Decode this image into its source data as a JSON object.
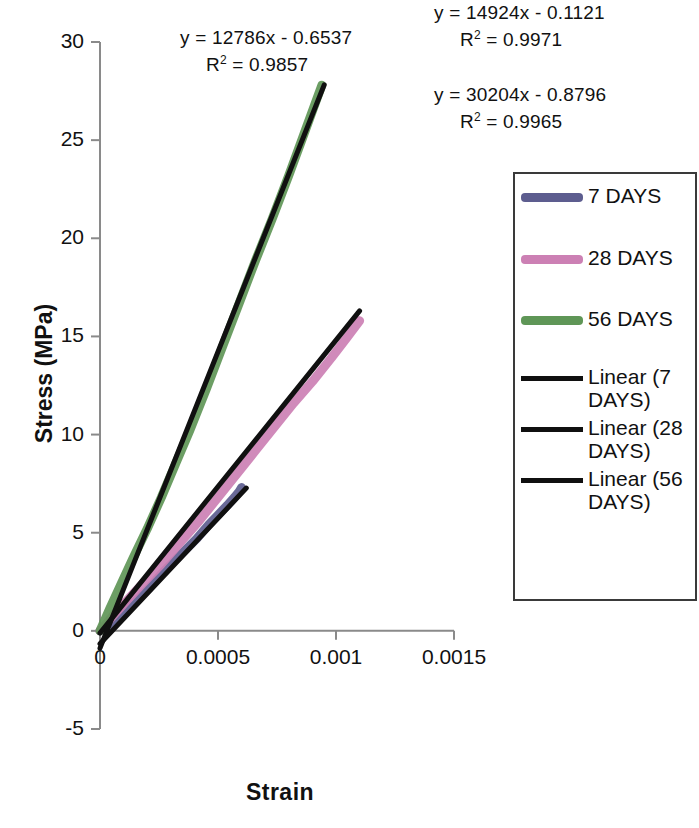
{
  "chart_data": {
    "type": "line",
    "title": "",
    "xlabel": "Strain",
    "ylabel": "Stress (MPa)",
    "xlim": [
      0,
      0.0015
    ],
    "ylim": [
      -5,
      30
    ],
    "xticks": [
      "0",
      "0.0005",
      "0.001",
      "0.0015"
    ],
    "xtick_values": [
      0,
      0.0005,
      0.001,
      0.0015
    ],
    "yticks": [
      "-5",
      "0",
      "5",
      "10",
      "15",
      "20",
      "25",
      "30"
    ],
    "ytick_values": [
      -5,
      0,
      5,
      10,
      15,
      20,
      25,
      30
    ],
    "grid": false,
    "legend_position": "right",
    "series": [
      {
        "name": "7 DAYS",
        "color": "#5d5d8f",
        "kind": "data",
        "x": [
          0,
          4e-05,
          9e-05,
          0.00015,
          0.00021,
          0.00026,
          0.00031,
          0.00036,
          0.00041,
          0.00046,
          0.0005,
          0.00054,
          0.00057,
          0.00059,
          0.0006
        ],
        "y": [
          0,
          0.35,
          0.9,
          1.5,
          2.2,
          2.9,
          3.5,
          4.1,
          4.7,
          5.4,
          5.9,
          6.4,
          6.8,
          7.1,
          7.3
        ]
      },
      {
        "name": "28 DAYS",
        "color": "#cc80b4",
        "kind": "data",
        "x": [
          0,
          5e-05,
          0.00011,
          0.00018,
          0.00026,
          0.00034,
          0.00042,
          0.0005,
          0.00058,
          0.00066,
          0.00074,
          0.00082,
          0.0009,
          0.00098,
          0.00105,
          0.0011
        ],
        "y": [
          0,
          0.7,
          1.5,
          2.4,
          3.4,
          4.5,
          5.6,
          6.8,
          8.0,
          9.2,
          10.4,
          11.6,
          12.7,
          13.9,
          15.0,
          15.8
        ]
      },
      {
        "name": "56 DAYS",
        "color": "#5f9657",
        "kind": "data",
        "x": [
          0,
          4e-05,
          9e-05,
          0.00014,
          0.0002,
          0.00026,
          0.00032,
          0.00038,
          0.00045,
          0.00052,
          0.00059,
          0.00066,
          0.00073,
          0.0008,
          0.00087,
          0.00094
        ],
        "y": [
          0,
          1.1,
          2.4,
          3.7,
          5.2,
          6.8,
          8.5,
          10.2,
          12.3,
          14.5,
          16.7,
          18.9,
          21.0,
          23.2,
          25.5,
          27.8
        ]
      },
      {
        "name": "Linear (7 DAYS)",
        "color": "#101010",
        "kind": "trendline",
        "slope": 12786,
        "intercept": -0.6537,
        "r2": 0.9857,
        "x_range": [
          0,
          0.00062
        ]
      },
      {
        "name": "Linear (28 DAYS)",
        "color": "#101010",
        "kind": "trendline",
        "slope": 14924,
        "intercept": -0.1121,
        "r2": 0.9971,
        "x_range": [
          0,
          0.0011
        ]
      },
      {
        "name": "Linear (56 DAYS)",
        "color": "#101010",
        "kind": "trendline",
        "slope": 30204,
        "intercept": -0.8796,
        "r2": 0.9965,
        "x_range": [
          0,
          0.00095
        ]
      }
    ],
    "annotations": [
      {
        "id": "eq_7",
        "equation": "y = 12786x - 0.6537",
        "r2_text": "R2 = 0.9857"
      },
      {
        "id": "eq_28",
        "equation": "y = 14924x - 0.1121",
        "r2_text": "R2 = 0.9971"
      },
      {
        "id": "eq_56",
        "equation": "y = 30204x - 0.8796",
        "r2_text": "R2 = 0.9965"
      }
    ]
  },
  "annotations": {
    "eq_7": {
      "line1": "y = 12786x - 0.6537",
      "r2_prefix": "R",
      "r2_sup": "2",
      "r2_value": " = 0.9857"
    },
    "eq_28": {
      "line1": "y = 14924x - 0.1121",
      "r2_prefix": "R",
      "r2_sup": "2",
      "r2_value": " = 0.9971"
    },
    "eq_56": {
      "line1": "y = 30204x - 0.8796",
      "r2_prefix": "R",
      "r2_sup": "2",
      "r2_value": " = 0.9965"
    }
  },
  "axes": {
    "y_title": "Stress (MPa)",
    "x_title": "Strain",
    "y_labels": [
      "30",
      "25",
      "20",
      "15",
      "10",
      "5",
      "0",
      "-5"
    ],
    "x_labels": [
      "0",
      "0.0005",
      "0.001",
      "0.0015"
    ]
  },
  "legend": {
    "items": [
      {
        "label": "7 DAYS",
        "color": "#5d5d8f",
        "style": "thick"
      },
      {
        "label": "28 DAYS",
        "color": "#cc80b4",
        "style": "thick"
      },
      {
        "label": "56 DAYS",
        "color": "#5f9657",
        "style": "thick"
      },
      {
        "label": "Linear (7\nDAYS)",
        "color": "#101010",
        "style": "thin"
      },
      {
        "label": "Linear (28\nDAYS)",
        "color": "#101010",
        "style": "thin"
      },
      {
        "label": "Linear (56\nDAYS)",
        "color": "#101010",
        "style": "thin"
      }
    ]
  }
}
